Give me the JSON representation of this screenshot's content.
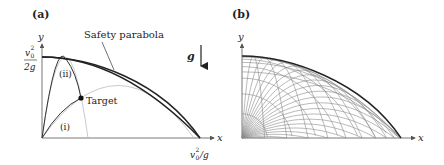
{
  "panel_a": {
    "label": "(a)",
    "y_axis_label": "y",
    "x_axis_label": "x",
    "y_tick_numerator": "v",
    "y_tick_sub": "0",
    "y_tick_sup": "2",
    "y_tick_denominator": "2g",
    "x_tick_v": "v",
    "x_tick_sub": "0",
    "x_tick_sup": "2",
    "x_tick_rest": "/g",
    "safety_label": "Safety parabola",
    "gravity_label": "g",
    "target_label": "Target",
    "trajectory_i_label": "(i)",
    "trajectory_ii_label": "(ii)"
  },
  "panel_b": {
    "label": "(b)",
    "y_axis_label": "y",
    "x_axis_label": "x"
  },
  "colors": {
    "axis": "#555555",
    "envelope": "#222222",
    "trajectory": "#333333",
    "faint": "#aaaaaa",
    "family": "#8a8a8a"
  }
}
